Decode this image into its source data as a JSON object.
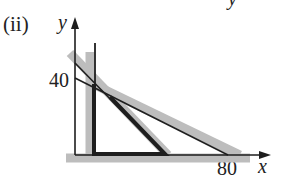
{
  "figure": {
    "part_label": "(ii)",
    "top_fragment": "y",
    "axes": {
      "x_label": "x",
      "y_label": "y",
      "y_tick": "40",
      "x_tick": "80"
    },
    "colors": {
      "line": "#1e1e1e",
      "shade": "#bdbdbd"
    }
  }
}
